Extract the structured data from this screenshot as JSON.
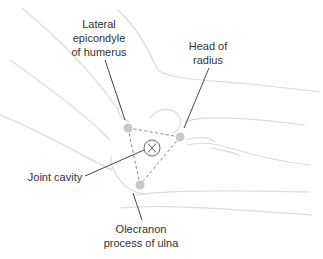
{
  "diagram": {
    "colors": {
      "outline": "#dcdcdc",
      "leader": "#333333",
      "dashed": "#888888",
      "dot": "#c8c8c8",
      "text": "#333333"
    },
    "labels": {
      "lateral_epicondyle": {
        "line1": "Lateral",
        "line2": "epicondyle",
        "line3": "of humerus"
      },
      "head_of_radius": {
        "line1": "Head of",
        "line2": "radius"
      },
      "joint_cavity": {
        "line1": "Joint cavity"
      },
      "olecranon": {
        "line1": "Olecranon",
        "line2": "process of ulna"
      }
    },
    "center_marker": {
      "glyph": "X"
    },
    "points": [
      {
        "name": "lateral-epicondyle",
        "x": 128,
        "y": 128
      },
      {
        "name": "head-of-radius",
        "x": 180,
        "y": 137
      },
      {
        "name": "olecranon",
        "x": 140,
        "y": 185
      }
    ]
  }
}
